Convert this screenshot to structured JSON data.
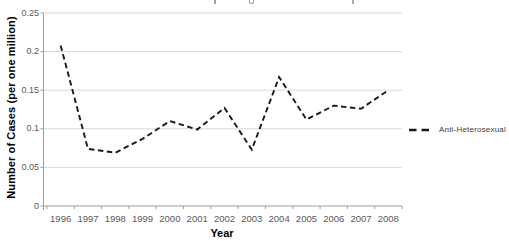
{
  "chart_data": {
    "type": "line",
    "categories": [
      "1996",
      "1997",
      "1998",
      "1999",
      "2000",
      "2001",
      "2002",
      "2003",
      "2004",
      "2005",
      "2006",
      "2007",
      "2008"
    ],
    "series": [
      {
        "name": "Anti-Heterosexual",
        "values": [
          0.208,
          0.074,
          0.069,
          0.087,
          0.11,
          0.099,
          0.127,
          0.073,
          0.167,
          0.112,
          0.13,
          0.126,
          0.15
        ],
        "line_style": "dashed",
        "color": "#1a1a1a"
      }
    ],
    "xlabel": "Year",
    "ylabel": "Number of Cases (per one million)",
    "ylim": [
      0,
      0.25
    ],
    "ytick_step": 0.05,
    "ytick_labels": [
      "0",
      "0.05",
      "0.1",
      "0.15",
      "0.2",
      "0.25"
    ],
    "grid": "horizontal-gridlines",
    "legend_position": "right",
    "legend_entries": [
      "Anti-Heterosexual"
    ],
    "title_cropped_at_top": true
  },
  "axes": {
    "x_title": "Year",
    "y_title": "Number of Cases (per one million)"
  },
  "legend": {
    "label": "Anti-Heterosexual"
  },
  "colors": {
    "line": "#1a1a1a",
    "gridline": "#d9d9d9",
    "axis": "#9e9e9e",
    "tick_label": "#595959",
    "axis_title": "#000000",
    "legend_text": "#404040",
    "background": "#ffffff"
  }
}
